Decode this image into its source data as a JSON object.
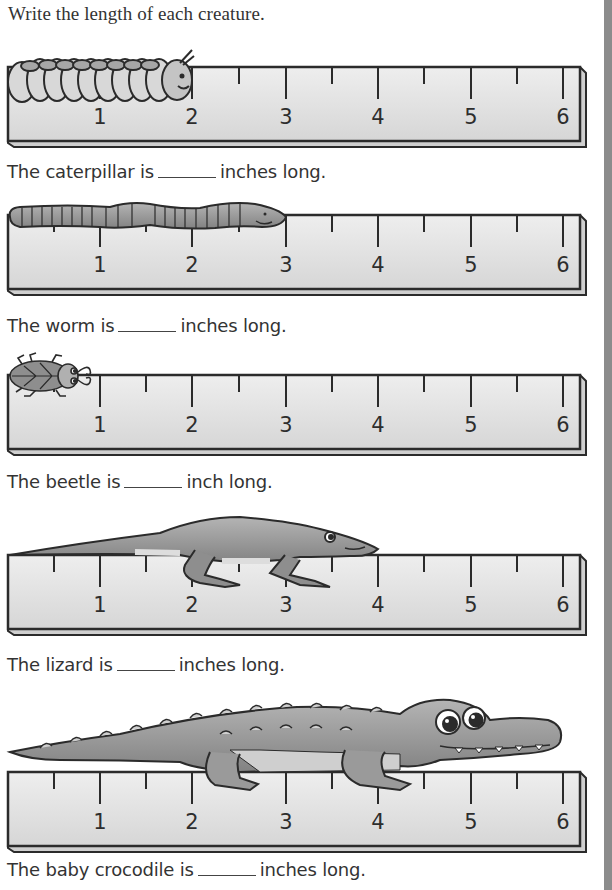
{
  "title": "Write the length of each creature.",
  "ruler": {
    "labels": [
      "1",
      "2",
      "3",
      "4",
      "5",
      "6"
    ],
    "unit": "inches"
  },
  "items": [
    {
      "creature": "caterpillar",
      "prefix": "The caterpillar is",
      "suffix": "inches long.",
      "answer_blank": "",
      "length_shown_in": 2
    },
    {
      "creature": "worm",
      "prefix": "The worm is",
      "suffix": "inches long.",
      "answer_blank": "",
      "length_shown_in": 3
    },
    {
      "creature": "beetle",
      "prefix": "The beetle is",
      "suffix": "inch long.",
      "answer_blank": "",
      "length_shown_in": 1
    },
    {
      "creature": "lizard",
      "prefix": "The lizard is",
      "suffix": "inches long.",
      "answer_blank": "",
      "length_shown_in": 4
    },
    {
      "creature": "baby crocodile",
      "prefix": "The baby crocodile is",
      "suffix": "inches long.",
      "answer_blank": "",
      "length_shown_in": 6
    }
  ],
  "colors": {
    "ruler_face": "#e2e2e2",
    "ruler_outline": "#2b2b2b",
    "creature_fill": "#9a9a9a",
    "edge_bar": "#8c8c8c"
  }
}
